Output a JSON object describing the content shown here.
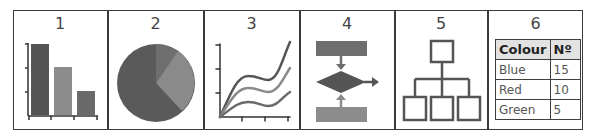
{
  "panels": [
    {
      "number": "1",
      "kind": "bar-chart"
    },
    {
      "number": "2",
      "kind": "pie-chart"
    },
    {
      "number": "3",
      "kind": "line-chart"
    },
    {
      "number": "4",
      "kind": "flowchart"
    },
    {
      "number": "5",
      "kind": "hierarchy-diagram"
    },
    {
      "number": "6",
      "kind": "table"
    }
  ],
  "table": {
    "headers": [
      "Colour",
      "Nº"
    ],
    "rows": [
      [
        "Blue",
        "15"
      ],
      [
        "Red",
        "10"
      ],
      [
        "Green",
        "5"
      ]
    ]
  },
  "colors": {
    "border": "#3a3a3a",
    "dark": "#555555",
    "medium": "#6e6e6e",
    "light": "#8c8c8c",
    "header_bg": "#e2e2e2"
  }
}
